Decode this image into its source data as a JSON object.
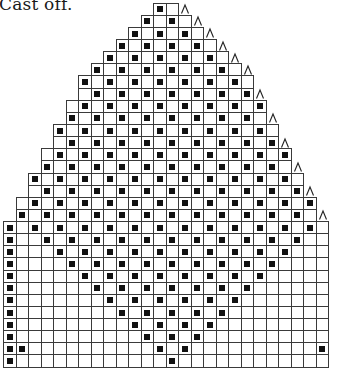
{
  "caption": "Cast off.",
  "chart": {
    "columns": 26,
    "grid": {
      "left": 3,
      "top": 2.7,
      "cell_width": 12.5,
      "row_height": 12.13
    },
    "colors": {
      "line": "#3a3a3a",
      "filled": "#111111",
      "background": "#ffffff"
    },
    "legend": {
      "filled_square": "black square stitch",
      "decrease_symbol": "^"
    },
    "rows": [
      {
        "row": 0,
        "start": 12,
        "end": 13,
        "filled": [
          12
        ],
        "decrease": true
      },
      {
        "row": 1,
        "start": 11,
        "end": 14,
        "filled": [
          11,
          13
        ],
        "decrease": true
      },
      {
        "row": 2,
        "start": 10,
        "end": 15,
        "filled": [
          10,
          12,
          14
        ],
        "decrease": true
      },
      {
        "row": 3,
        "start": 9,
        "end": 16,
        "filled": [
          9,
          11,
          13,
          15
        ],
        "decrease": true
      },
      {
        "row": 4,
        "start": 8,
        "end": 17,
        "filled": [
          8,
          10,
          12,
          14,
          16
        ],
        "decrease": true
      },
      {
        "row": 5,
        "start": 7,
        "end": 18,
        "filled": [
          7,
          9,
          11,
          13,
          15,
          17
        ],
        "decrease": true
      },
      {
        "row": 6,
        "start": 6,
        "end": 19,
        "filled": [
          6,
          8,
          10,
          12,
          14,
          16,
          18
        ],
        "decrease": false
      },
      {
        "row": 7,
        "start": 6,
        "end": 19,
        "filled": [
          7,
          9,
          11,
          13,
          15,
          17,
          19
        ],
        "decrease": true
      },
      {
        "row": 8,
        "start": 5,
        "end": 20,
        "filled": [
          6,
          8,
          10,
          12,
          14,
          16,
          18,
          20
        ],
        "decrease": false
      },
      {
        "row": 9,
        "start": 5,
        "end": 20,
        "filled": [
          5,
          7,
          9,
          11,
          13,
          15,
          17,
          19
        ],
        "decrease": true
      },
      {
        "row": 10,
        "start": 4,
        "end": 21,
        "filled": [
          4,
          6,
          8,
          10,
          12,
          14,
          16,
          18,
          20
        ],
        "decrease": false
      },
      {
        "row": 11,
        "start": 4,
        "end": 21,
        "filled": [
          5,
          7,
          9,
          11,
          13,
          15,
          17,
          19,
          21
        ],
        "decrease": true
      },
      {
        "row": 12,
        "start": 3,
        "end": 22,
        "filled": [
          4,
          6,
          8,
          10,
          12,
          14,
          16,
          18,
          20,
          22
        ],
        "decrease": false
      },
      {
        "row": 13,
        "start": 3,
        "end": 22,
        "filled": [
          3,
          5,
          7,
          9,
          11,
          13,
          15,
          17,
          19,
          21
        ],
        "decrease": true
      },
      {
        "row": 14,
        "start": 2,
        "end": 23,
        "filled": [
          2,
          4,
          6,
          8,
          10,
          12,
          14,
          16,
          18,
          20,
          22
        ],
        "decrease": false
      },
      {
        "row": 15,
        "start": 2,
        "end": 23,
        "filled": [
          3,
          5,
          7,
          9,
          11,
          13,
          15,
          17,
          19,
          21,
          23
        ],
        "decrease": true
      },
      {
        "row": 16,
        "start": 1,
        "end": 24,
        "filled": [
          2,
          4,
          6,
          8,
          10,
          12,
          14,
          16,
          18,
          20,
          22,
          24
        ],
        "decrease": false
      },
      {
        "row": 17,
        "start": 1,
        "end": 24,
        "filled": [
          1,
          3,
          5,
          7,
          9,
          11,
          13,
          15,
          17,
          19,
          21,
          23
        ],
        "decrease": true
      },
      {
        "row": 18,
        "start": 0,
        "end": 25,
        "filled": [
          0,
          2,
          4,
          6,
          8,
          10,
          12,
          14,
          16,
          18,
          20,
          22,
          24
        ],
        "decrease": false
      },
      {
        "row": 19,
        "start": 0,
        "end": 25,
        "filled": [
          0,
          3,
          5,
          7,
          9,
          11,
          13,
          15,
          17,
          19,
          21,
          23
        ],
        "decrease": false
      },
      {
        "row": 20,
        "start": 0,
        "end": 25,
        "filled": [
          0,
          4,
          6,
          8,
          10,
          12,
          14,
          16,
          18,
          20,
          22
        ],
        "decrease": false
      },
      {
        "row": 21,
        "start": 0,
        "end": 25,
        "filled": [
          0,
          5,
          7,
          9,
          11,
          13,
          15,
          17,
          19,
          21
        ],
        "decrease": false
      },
      {
        "row": 22,
        "start": 0,
        "end": 25,
        "filled": [
          0,
          6,
          8,
          10,
          12,
          14,
          16,
          18,
          20
        ],
        "decrease": false
      },
      {
        "row": 23,
        "start": 0,
        "end": 25,
        "filled": [
          0,
          7,
          9,
          11,
          13,
          15,
          17,
          19
        ],
        "decrease": false
      },
      {
        "row": 24,
        "start": 0,
        "end": 25,
        "filled": [
          0,
          8,
          10,
          12,
          14,
          16,
          18
        ],
        "decrease": false
      },
      {
        "row": 25,
        "start": 0,
        "end": 25,
        "filled": [
          0,
          9,
          11,
          13,
          15,
          17
        ],
        "decrease": false
      },
      {
        "row": 26,
        "start": 0,
        "end": 25,
        "filled": [
          0,
          10,
          12,
          14,
          16
        ],
        "decrease": false
      },
      {
        "row": 27,
        "start": 0,
        "end": 25,
        "filled": [
          0,
          11,
          13,
          15
        ],
        "decrease": false
      },
      {
        "row": 28,
        "start": 0,
        "end": 25,
        "filled": [
          0,
          1,
          12,
          14,
          25
        ],
        "decrease": false
      },
      {
        "row": 29,
        "start": 0,
        "end": 25,
        "filled": [
          0,
          13
        ],
        "decrease": false
      }
    ]
  }
}
